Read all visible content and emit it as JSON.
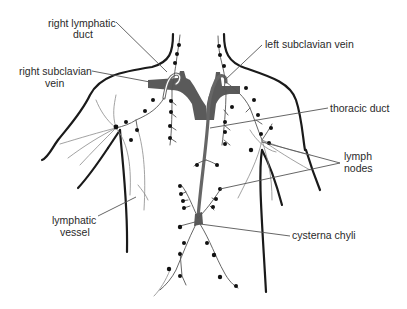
{
  "diagram": {
    "colors": {
      "background": "#ffffff",
      "outline": "#1a1a1a",
      "vein": "#5a5a5a",
      "duct": "#666666",
      "node": "#111111",
      "vessel": "#555555",
      "label_text": "#2a2a2a"
    },
    "labels": {
      "right_lymphatic_duct": {
        "line1": "right lymphatic",
        "line2": "duct"
      },
      "right_subclavian_vein": {
        "line1": "right subclavian",
        "line2": "vein"
      },
      "left_subclavian_vein": {
        "line1": "left subclavian vein"
      },
      "thoracic_duct": {
        "line1": "thoracic duct"
      },
      "lymph_nodes": {
        "line1": "lymph",
        "line2": "nodes"
      },
      "lymphatic_vessel": {
        "line1": "lymphatic",
        "line2": "vessel"
      },
      "cysterna_chyli": {
        "line1": "cysterna chyli"
      }
    }
  }
}
